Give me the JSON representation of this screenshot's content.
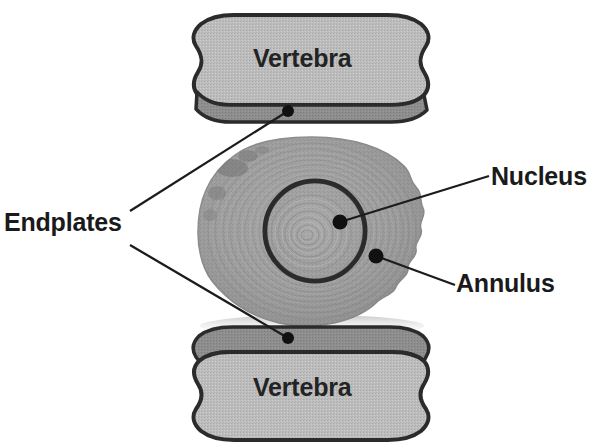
{
  "figure": {
    "width": 590,
    "height": 446
  },
  "labels": {
    "vertebra_top": "Vertebra",
    "vertebra_bottom": "Vertebra",
    "endplates": "Endplates",
    "nucleus": "Nucleus",
    "annulus": "Annulus"
  },
  "colors": {
    "background": "#ffffff",
    "text": "#1a1a1a",
    "vertebra_body_fill": "#b6b6b6",
    "vertebra_body_fill_light": "#c2c2c2",
    "vertebra_outline": "#2e2e2e",
    "endplate_band": "#8a8a8a",
    "disc_outer": "#9a9a9a",
    "disc_mid": "#a4a4a4",
    "nucleus_fill": "#a8a8a8",
    "nucleus_ring": "#2b2b2b",
    "leader_line": "#1c1c1c",
    "marker_dot": "#111111"
  },
  "structures": [
    {
      "name": "vertebra-top",
      "label": "Vertebra",
      "kind": "bone",
      "position": "top",
      "bounds": {
        "x": 186,
        "y": 14,
        "width": 250,
        "height": 105
      }
    },
    {
      "name": "vertebra-bottom",
      "label": "Vertebra",
      "kind": "bone",
      "position": "bottom",
      "bounds": {
        "x": 186,
        "y": 327,
        "width": 250,
        "height": 105
      }
    },
    {
      "name": "intervertebral-disc",
      "label": "Annulus",
      "kind": "disc",
      "position": "center",
      "bounds": {
        "x": 198,
        "y": 137,
        "width": 227,
        "height": 190
      }
    },
    {
      "name": "nucleus-pulposus",
      "label": "Nucleus",
      "kind": "nucleus",
      "position": "center",
      "bounds": {
        "x": 266,
        "y": 181,
        "width": 99,
        "height": 99
      }
    }
  ],
  "leaders": [
    {
      "name": "endplates-upper",
      "label": "Endplates",
      "from": {
        "x": 130,
        "y": 211
      },
      "to": {
        "x": 288,
        "y": 111
      },
      "marker": {
        "x": 288,
        "y": 111,
        "r": 6
      }
    },
    {
      "name": "endplates-lower",
      "label": "Endplates",
      "from": {
        "x": 130,
        "y": 245
      },
      "to": {
        "x": 288,
        "y": 338
      },
      "marker": {
        "x": 288,
        "y": 338,
        "r": 6
      }
    },
    {
      "name": "nucleus-leader",
      "label": "Nucleus",
      "from": {
        "x": 489,
        "y": 176
      },
      "to": {
        "x": 340,
        "y": 222
      },
      "marker": {
        "x": 340,
        "y": 222,
        "r": 7
      }
    },
    {
      "name": "annulus-leader",
      "label": "Annulus",
      "from": {
        "x": 455,
        "y": 285
      },
      "to": {
        "x": 376,
        "y": 256
      },
      "marker": {
        "x": 376,
        "y": 256,
        "r": 7
      }
    }
  ]
}
